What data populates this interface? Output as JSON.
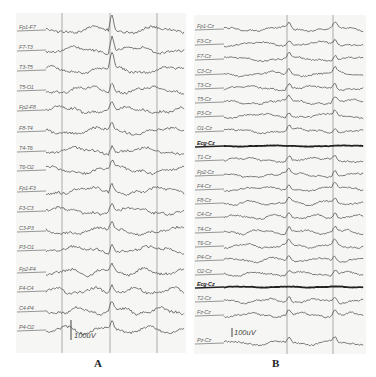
{
  "figure": {
    "panels": [
      {
        "id": "A",
        "caption": "A",
        "montage": "bipolar",
        "scale_bar": "100uV",
        "vertical_markers_px": [
          46,
          94,
          141
        ],
        "channels": [
          "Fp1-F7",
          "F7-T3",
          "T3-T5",
          "T5-O1",
          "Fp2-F8",
          "F8-T4",
          "T4-T6",
          "T6-O2",
          "Fp1-F3",
          "F3-C3",
          "C3-P3",
          "P3-O1",
          "Fp2-F4",
          "F4-C4",
          "C4-P4",
          "P4-O2"
        ],
        "row_y": [
          17,
          37,
          57,
          77,
          97,
          118,
          138,
          157,
          178,
          198,
          218,
          237,
          259,
          278,
          298,
          317
        ]
      },
      {
        "id": "B",
        "caption": "B",
        "montage": "referential (Cz)",
        "scale_bar": "100uV",
        "vertical_markers_px": [
          93,
          139
        ],
        "channels": [
          "Fp1-Cz",
          "F3-Cz",
          "F7-Cz",
          "C3-Cz",
          "T3-Cz",
          "T5-Cz",
          "P3-Cz",
          "O1-Cz",
          "Ecg-Cz",
          "T1-Cz",
          "Fp2-Cz",
          "F4-Cz",
          "F8-Cz",
          "C4-Cz",
          "T4-Cz",
          "T6-Cz",
          "P4-Cz",
          "O2-Cz",
          "Ecg-Cz",
          "T2-Cz",
          "Fz-Cz",
          "Pz-Cz"
        ],
        "bold_channels": [
          8,
          18
        ],
        "row_y": [
          14,
          29,
          44,
          59,
          73,
          87,
          101,
          116,
          131,
          145,
          160,
          174,
          188,
          202,
          217,
          231,
          245,
          259,
          272,
          286,
          300,
          328
        ]
      }
    ],
    "colors": {
      "trace": "#555555",
      "trace_bold": "#222222",
      "marker": "#9a9a9a",
      "background": "#f6f6f4"
    }
  }
}
